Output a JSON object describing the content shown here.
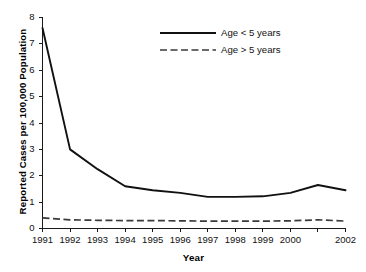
{
  "chart_data": {
    "type": "line",
    "title": "",
    "xlabel": "Year",
    "ylabel": "Reported Cases per 100,000 Population",
    "x": [
      1991,
      1992,
      1993,
      1994,
      1995,
      1996,
      1997,
      1998,
      1999,
      2000,
      2001,
      2002
    ],
    "xtick_labels": [
      "1991",
      "1992",
      "1993",
      "1994",
      "1995",
      "1996",
      "1997",
      "1998",
      "1999",
      "2000",
      "",
      "2002"
    ],
    "ytick_labels": [
      "0",
      "1",
      "2",
      "3",
      "4",
      "5",
      "6",
      "7",
      "8"
    ],
    "ylim": [
      0,
      8
    ],
    "xlim": [
      1991,
      2002
    ],
    "grid": false,
    "legend_position": "top-center-right",
    "series": [
      {
        "name": "Age < 5 years",
        "style": "solid",
        "color": "#111111",
        "values": [
          7.6,
          3.0,
          2.25,
          1.6,
          1.45,
          1.35,
          1.2,
          1.2,
          1.22,
          1.35,
          1.65,
          1.45
        ]
      },
      {
        "name": "Age > 5 years",
        "style": "dashed",
        "color": "#3a3a3a",
        "values": [
          0.4,
          0.33,
          0.31,
          0.3,
          0.3,
          0.29,
          0.28,
          0.28,
          0.28,
          0.29,
          0.33,
          0.28
        ]
      }
    ]
  },
  "axes": {
    "y_title": "Reported Cases per 100,000 Population",
    "x_title": "Year"
  },
  "legend": {
    "items": [
      {
        "label": "Age < 5 years",
        "style": "solid"
      },
      {
        "label": "Age > 5 years",
        "style": "dashed"
      }
    ]
  }
}
